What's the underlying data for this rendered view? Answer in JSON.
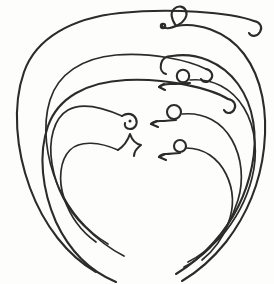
{
  "plate": {
    "title": "Plate of curved wire rings",
    "description": "Antiquarian line drawing of nested curved metal wire objects (neck-rings / bow fibulae) shown in profile, fanned out one inside another",
    "width": 274,
    "height": 284,
    "background_color": "#fdfdfc",
    "ink_color": "#2b2b2b",
    "object_count": 10
  },
  "objects": [
    {
      "id": "ring-left-1",
      "label": "Outermost left arc",
      "side": "left",
      "terminal_left": "plain-taper",
      "terminal_right": "recurved-hook",
      "stroke": "wire-med",
      "path": "M 254 21 C 230 12 170 8 120 13 C 72 18 36 38 24 72 C 12 106 16 150 30 188 C 44 226 68 256 96 272",
      "terminal_path": "M 254 21 C 260 22 263 27 260 32 C 257 37 251 37 249 33"
    },
    {
      "id": "ring-left-2",
      "label": "Second left arc",
      "side": "left",
      "terminal_left": "plain-taper",
      "terminal_right": "recurved-hook",
      "stroke": "wire-med",
      "path": "M 228 99 C 210 88 166 78 126 80 C 86 82 58 98 48 126 C 38 154 42 190 56 222 C 70 252 92 272 116 282",
      "terminal_path": "M 228 99 C 234 100 237 105 234 110 C 231 114 226 114 224 110"
    },
    {
      "id": "ring-left-3",
      "label": "Third left arc",
      "side": "left",
      "terminal_left": "plain-taper",
      "terminal_right": "recurved-hook",
      "stroke": "wire-thin",
      "path": "M 206 69 C 188 60 150 52 116 55 C 82 58 58 74 50 100 C 42 126 46 158 58 186 C 70 212 88 232 108 244",
      "terminal_path": "M 206 69 C 211 70 214 75 211 79 C 208 83 203 83 201 79"
    },
    {
      "id": "ring-left-4",
      "label": "Fourth left arc with coiled terminal",
      "side": "left",
      "terminal_left": "plain-taper",
      "terminal_right": "spiral-coil",
      "stroke": "wire-thin",
      "path": "M 122 116 C 104 108 82 102 68 110 C 54 118 48 140 52 164 C 56 188 68 210 84 226 C 98 240 112 250 124 256",
      "terminal_path": "M 122 116 C 128 112 134 114 136 119 C 138 124 135 129 130 129 C 126 129 124 126 125 123"
    },
    {
      "id": "ring-left-5",
      "label": "Innermost left arc with zigzag terminal",
      "side": "left",
      "terminal_left": "plain-taper",
      "terminal_right": "zigzag-hook",
      "stroke": "wire-thin",
      "path": "M 118 150 C 100 142 80 140 70 150 C 60 160 58 180 64 198 C 70 216 82 232 96 242",
      "terminal_path": "M 118 150 C 124 146 128 140 130 134 C 132 140 136 144 141 145 C 137 148 134 152 134 156"
    },
    {
      "id": "ring-right-1",
      "label": "Outermost right arc with eye loop",
      "side": "right",
      "terminal_left": "eye-loop",
      "terminal_right": "plain-taper",
      "stroke": "wire-med",
      "path": "M 176 26 C 196 22 226 30 244 54 C 262 78 268 112 264 148 C 260 184 246 216 226 242 C 210 262 194 274 182 281",
      "terminal_path": "M 176 26 C 172 20 170 13 174 9 C 178 5 184 6 186 11 C 188 16 184 22 178 25 C 172 28 166 29 163 27 C 161 26 162 24 164 24",
      "has_ball_end": true,
      "ball_position": [
        163,
        27
      ]
    },
    {
      "id": "ring-right-2",
      "label": "Second right arc with plain hook",
      "side": "right",
      "terminal_left": "angled-hook",
      "terminal_right": "plain-taper",
      "stroke": "wire-med",
      "path": "M 172 56 C 196 52 222 62 238 84 C 254 106 258 136 252 166 C 246 196 232 222 214 242 C 200 258 186 268 176 274",
      "terminal_path": "M 172 56 C 166 56 162 59 161 64 C 160 69 162 73 166 74"
    },
    {
      "id": "ring-right-3",
      "label": "Third right arc with raised eye loop",
      "side": "right",
      "terminal_left": "raised-eye-loop",
      "terminal_right": "plain-taper",
      "stroke": "wire-thin",
      "path": "M 190 80 C 212 78 232 88 244 108 C 256 128 258 154 252 178 C 246 202 234 222 220 238 C 208 250 196 258 188 262",
      "terminal_path": "M 190 80 C 188 74 184 70 180 71 C 176 72 175 77 178 80 C 181 83 186 82 189 80 C 184 82 176 83 168 83 C 164 83 160 84 158 86",
      "has_ball_end": true,
      "ball_position": [
        158,
        86
      ]
    },
    {
      "id": "ring-right-4",
      "label": "Fourth right arc with eye loop",
      "side": "right",
      "terminal_left": "raised-eye-loop",
      "terminal_right": "plain-taper",
      "stroke": "wire-thin",
      "path": "M 182 114 C 204 112 222 122 232 140 C 242 158 244 180 238 200 C 232 220 222 236 210 248 C 200 258 190 264 184 267",
      "terminal_path": "M 182 114 C 180 108 176 103 171 104 C 166 105 164 111 167 115 C 170 119 176 118 180 115 C 174 118 166 120 160 120 C 156 120 153 121 152 123",
      "has_ball_end": true,
      "ball_position": [
        152,
        123
      ]
    },
    {
      "id": "ring-right-5",
      "label": "Innermost right arc with eye loop",
      "side": "right",
      "terminal_left": "raised-eye-loop",
      "terminal_right": "plain-taper",
      "stroke": "wire-thin",
      "path": "M 186 148 C 204 148 218 158 226 174 C 234 190 234 208 228 224 C 222 240 212 252 202 260",
      "terminal_path": "M 186 148 C 184 142 180 138 175 139 C 170 140 169 146 172 150 C 175 154 181 153 184 150 C 179 152 172 154 167 154 C 163 154 161 155 160 157",
      "has_ball_end": true,
      "ball_position": [
        160,
        157
      ]
    }
  ],
  "crossing_nodes": [
    {
      "id": "left-fan-node",
      "x": 72,
      "y": 148,
      "label": "left fan crossing point"
    },
    {
      "id": "right-fan-node",
      "x": 252,
      "y": 136,
      "label": "right fan crossing point"
    }
  ]
}
